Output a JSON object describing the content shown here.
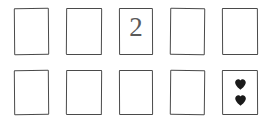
{
  "scene": {
    "title": "Hand-drawn playing card grid",
    "background_color": "#ffffff",
    "ink_color": "#4a4a4a",
    "pip_color": "#1a1a1a",
    "rows": 2,
    "columns": 5,
    "total_cards": 10
  },
  "cards": [
    {
      "id": "card-r1c1",
      "row": 1,
      "col": 1,
      "rank": "",
      "suit": "",
      "pip_count": 0,
      "face": "blank",
      "x": 14,
      "y": 8,
      "w": 35,
      "h": 47
    },
    {
      "id": "card-r1c2",
      "row": 1,
      "col": 2,
      "rank": "",
      "suit": "",
      "pip_count": 0,
      "face": "blank",
      "x": 66,
      "y": 8,
      "w": 36,
      "h": 47
    },
    {
      "id": "card-r1c3",
      "row": 1,
      "col": 3,
      "rank": "2",
      "suit": "",
      "pip_count": 0,
      "face": "rank",
      "x": 119,
      "y": 8,
      "w": 34,
      "h": 47
    },
    {
      "id": "card-r1c4",
      "row": 1,
      "col": 4,
      "rank": "",
      "suit": "",
      "pip_count": 0,
      "face": "blank",
      "x": 170,
      "y": 8,
      "w": 35,
      "h": 47
    },
    {
      "id": "card-r1c5",
      "row": 1,
      "col": 5,
      "rank": "",
      "suit": "",
      "pip_count": 0,
      "face": "blank",
      "x": 222,
      "y": 8,
      "w": 36,
      "h": 47
    },
    {
      "id": "card-r2c1",
      "row": 2,
      "col": 1,
      "rank": "",
      "suit": "",
      "pip_count": 0,
      "face": "blank",
      "x": 14,
      "y": 70,
      "w": 35,
      "h": 45
    },
    {
      "id": "card-r2c2",
      "row": 2,
      "col": 2,
      "rank": "",
      "suit": "",
      "pip_count": 0,
      "face": "blank",
      "x": 66,
      "y": 70,
      "w": 36,
      "h": 45
    },
    {
      "id": "card-r2c3",
      "row": 2,
      "col": 3,
      "rank": "",
      "suit": "",
      "pip_count": 0,
      "face": "blank",
      "x": 119,
      "y": 70,
      "w": 34,
      "h": 45
    },
    {
      "id": "card-r2c4",
      "row": 2,
      "col": 4,
      "rank": "",
      "suit": "",
      "pip_count": 0,
      "face": "blank",
      "x": 170,
      "y": 70,
      "w": 35,
      "h": 45
    },
    {
      "id": "card-r2c5",
      "row": 2,
      "col": 5,
      "rank": "",
      "suit": "hearts",
      "pip_count": 2,
      "face": "pips",
      "x": 222,
      "y": 70,
      "w": 36,
      "h": 45
    }
  ]
}
